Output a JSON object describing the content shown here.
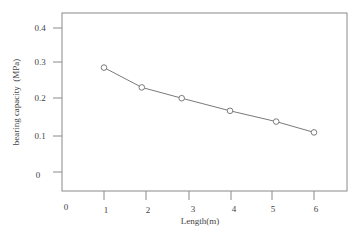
{
  "chart_data": {
    "type": "line",
    "title": "",
    "xlabel": "Length(m)",
    "ylabel": "bearing capacity  (MPa)",
    "x_tick_labels": [
      "0",
      "1",
      "2",
      "3",
      "4",
      "5",
      "6"
    ],
    "y_tick_labels": [
      "0",
      "0.1",
      "0.2",
      "0.3",
      "0.4"
    ],
    "xlim": [
      0,
      6.7
    ],
    "ylim": [
      -0.05,
      0.45
    ],
    "grid": false,
    "legend": null,
    "series": [
      {
        "name": "bearing capacity",
        "marker": "open-circle",
        "x": [
          1,
          1.9,
          2.85,
          4,
          5.1,
          6
        ],
        "y": [
          0.29,
          0.235,
          0.205,
          0.17,
          0.14,
          0.11
        ]
      }
    ]
  },
  "colors": {
    "frame": "#8a8a8a",
    "line": "#7a7a7a",
    "text": "#444444"
  }
}
